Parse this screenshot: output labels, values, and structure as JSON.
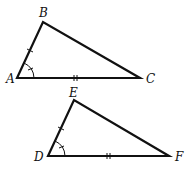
{
  "triangles": [
    {
      "name": "ABC",
      "vertices": {
        "A": [
          17,
          78
        ],
        "B": [
          43,
          22
        ],
        "C": [
          140,
          78
        ]
      },
      "labels": {
        "A": "A",
        "B": "B",
        "C": "C"
      },
      "marks": {
        "AB": "single tick",
        "AC": "double tick",
        "angle_A": "arc with tick"
      }
    },
    {
      "name": "DEF",
      "vertices": {
        "D": [
          48,
          156
        ],
        "E": [
          74,
          100
        ],
        "F": [
          169,
          156
        ]
      },
      "labels": {
        "D": "D",
        "E": "E",
        "F": "F"
      },
      "marks": {
        "DE": "single tick",
        "DF": "double tick",
        "angle_D": "arc with tick"
      }
    }
  ],
  "stroke_color": "#111111"
}
